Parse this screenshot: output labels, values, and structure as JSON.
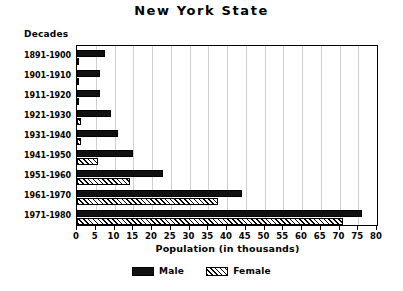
{
  "chart_data": {
    "type": "bar",
    "orientation": "horizontal",
    "title": "New York State",
    "xlabel": "Population (in thousands)",
    "ylabel": "Decades",
    "categories": [
      "1891-1900",
      "1901-1910",
      "1911-1920",
      "1921-1930",
      "1931-1940",
      "1941-1950",
      "1951-1960",
      "1961-1970",
      "1971-1980"
    ],
    "series": [
      {
        "name": "Male",
        "values": [
          7.5,
          6.0,
          6.0,
          9.0,
          11.0,
          15.0,
          23.0,
          44.0,
          76.0
        ]
      },
      {
        "name": "Female",
        "values": [
          0.4,
          0.3,
          0.6,
          1.0,
          1.0,
          5.5,
          14.0,
          37.5,
          71.0
        ]
      }
    ],
    "xlim": [
      0,
      80
    ],
    "xticks": [
      0,
      5,
      10,
      15,
      20,
      25,
      30,
      35,
      40,
      45,
      50,
      55,
      60,
      65,
      70,
      75,
      80
    ],
    "xtick_labels": [
      "0",
      "5",
      "10",
      "15",
      "20",
      "25",
      "30",
      "35",
      "40",
      "45",
      "50",
      "55",
      "60",
      "65",
      "70",
      "75",
      "80"
    ],
    "grid": true,
    "grid_axis": "x",
    "legend_position": "bottom-center",
    "legend": [
      {
        "label": "Male",
        "pattern": "solid",
        "color": "#111111"
      },
      {
        "label": "Female",
        "pattern": "hatched",
        "color": "#ffffff"
      }
    ]
  }
}
